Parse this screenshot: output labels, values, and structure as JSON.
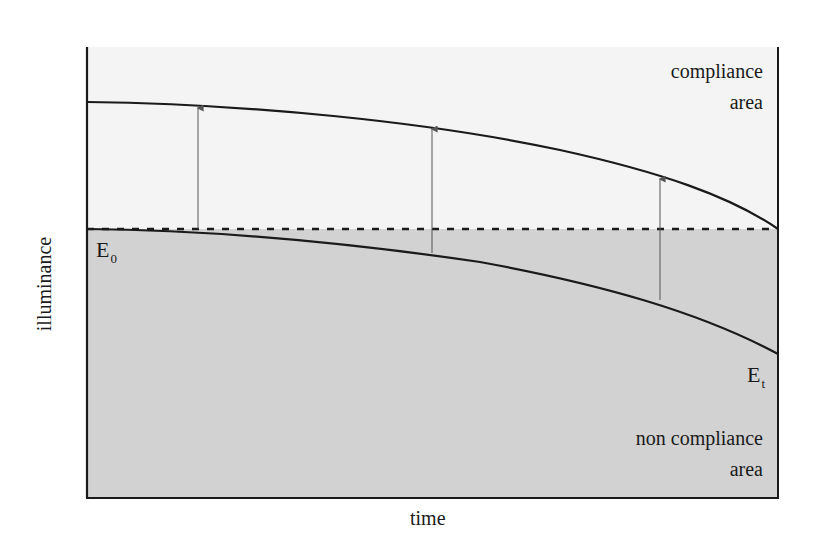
{
  "diagram": {
    "type": "illuminance-maintenance-diagram",
    "axes": {
      "x_label": "time",
      "y_label": "illuminance"
    },
    "regions": {
      "upper": {
        "label_line1": "compliance",
        "label_line2": "area",
        "fill": "#f4f4f4"
      },
      "lower": {
        "label_line1": "non compliance",
        "label_line2": "area",
        "fill": "#d2d2d2"
      }
    },
    "symbols": {
      "e0": {
        "base": "E",
        "sub": "0"
      },
      "et": {
        "base": "E",
        "sub": "t"
      }
    },
    "lines": {
      "threshold": {
        "name": "E0 maintained illuminance",
        "style": "dashed",
        "y": 229
      },
      "upper_curve": {
        "name": "initial illuminance curve",
        "points": [
          [
            87,
            102
          ],
          [
            230,
            107
          ],
          [
            430,
            127
          ],
          [
            480,
            134
          ],
          [
            660,
            176
          ],
          [
            778,
            229
          ]
        ]
      },
      "lower_curve": {
        "name": "illuminance decay curve Et",
        "points": [
          [
            87,
            229
          ],
          [
            198,
            229
          ],
          [
            250,
            234
          ],
          [
            432,
            254
          ],
          [
            480,
            262
          ],
          [
            660,
            301
          ],
          [
            778,
            354
          ]
        ]
      }
    },
    "arrows": [
      {
        "x": 198,
        "from_y": 229,
        "to_y": 106
      },
      {
        "x": 432,
        "from_y": 253,
        "to_y": 127
      },
      {
        "x": 660,
        "from_y": 300,
        "to_y": 177
      }
    ],
    "colors": {
      "line": "#1a1a1a",
      "arrow": "#555555",
      "background": "#ffffff"
    }
  }
}
